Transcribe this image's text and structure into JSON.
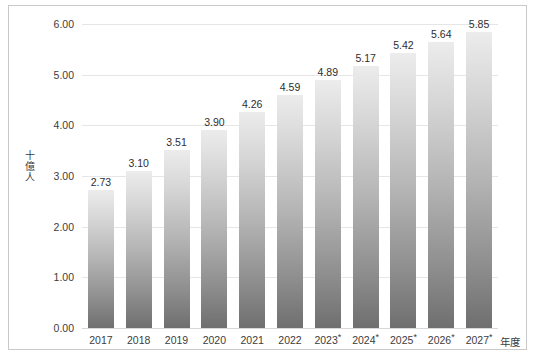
{
  "chart_data": {
    "type": "bar",
    "title": "",
    "subtitle": "",
    "xlabel": "年度",
    "ylabel": "十億人",
    "ylabel_chars": [
      "十",
      "億",
      "人"
    ],
    "categories": [
      "2017",
      "2018",
      "2019",
      "2020",
      "2021",
      "2022",
      "2023*",
      "2024*",
      "2025*",
      "2026*",
      "2027*"
    ],
    "values": [
      2.73,
      3.1,
      3.51,
      3.9,
      4.26,
      4.59,
      4.89,
      5.17,
      5.42,
      5.64,
      5.85
    ],
    "value_labels": [
      "2.73",
      "3.10",
      "3.51",
      "3.90",
      "4.26",
      "4.59",
      "4.89",
      "5.17",
      "5.42",
      "5.64",
      "5.85"
    ],
    "ylim": [
      0.0,
      6.0
    ],
    "ytick_values": [
      0.0,
      1.0,
      2.0,
      3.0,
      4.0,
      5.0,
      6.0
    ],
    "ytick_labels": [
      "0.00",
      "1.00",
      "2.00",
      "3.00",
      "4.00",
      "5.00",
      "6.00"
    ],
    "grid": true,
    "grid_axis": "y",
    "legend": false,
    "legend_position": "none",
    "forecast_marker": "*",
    "forecast_categories": [
      "2023*",
      "2024*",
      "2025*",
      "2026*",
      "2027*"
    ],
    "bar_gradient_top": "#ececec",
    "bar_gradient_bottom": "#6f6f6f",
    "gridline_color": "#e6e6e6",
    "text_color": "#3c3c3c",
    "background_color": "#ffffff",
    "frame_color": "#c9c9c9"
  },
  "source_strip": ""
}
